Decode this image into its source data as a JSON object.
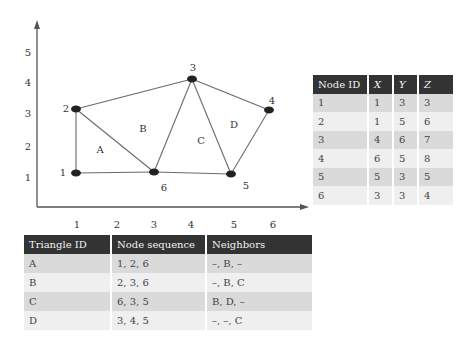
{
  "plot": {
    "x_ticks": [
      "1",
      "2",
      "3",
      "4",
      "5",
      "6"
    ],
    "y_ticks": [
      "1",
      "2",
      "3",
      "4",
      "5"
    ],
    "nodes": [
      {
        "id": "1",
        "label": "1"
      },
      {
        "id": "2",
        "label": "2"
      },
      {
        "id": "3",
        "label": "3"
      },
      {
        "id": "4",
        "label": "4"
      },
      {
        "id": "5",
        "label": "5"
      },
      {
        "id": "6",
        "label": "6"
      }
    ],
    "triangles": [
      {
        "id": "A",
        "label": "A"
      },
      {
        "id": "B",
        "label": "B"
      },
      {
        "id": "C",
        "label": "C"
      },
      {
        "id": "D",
        "label": "D"
      }
    ]
  },
  "node_table": {
    "headers": [
      "Node ID",
      "X",
      "Y",
      "Z"
    ],
    "rows": [
      [
        "1",
        "1",
        "3",
        "3"
      ],
      [
        "2",
        "1",
        "5",
        "6"
      ],
      [
        "3",
        "4",
        "6",
        "7"
      ],
      [
        "4",
        "6",
        "5",
        "8"
      ],
      [
        "5",
        "5",
        "3",
        "5"
      ],
      [
        "6",
        "3",
        "3",
        "4"
      ]
    ]
  },
  "triangle_table": {
    "headers": [
      "Triangle ID",
      "Node sequence",
      "Neighbors"
    ],
    "rows": [
      [
        "A",
        "1, 2, 6",
        "–, B, –"
      ],
      [
        "B",
        "2, 3, 6",
        "–, B, C"
      ],
      [
        "C",
        "6, 3, 5",
        "B, D, –"
      ],
      [
        "D",
        "3, 4, 5",
        "–, –, C"
      ]
    ]
  },
  "colors": {
    "header_bg": "#333333",
    "row_odd": "#dadada",
    "row_even": "#efefef",
    "edge": "#666666",
    "node": "#222222"
  }
}
